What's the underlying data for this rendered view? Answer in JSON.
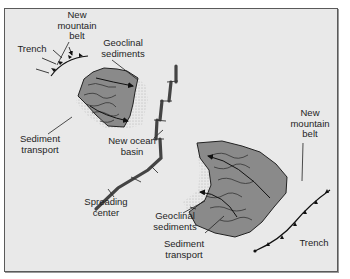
{
  "diagram": {
    "type": "plate tectonics / continental rifting",
    "colors": {
      "background": "#e9e9e9",
      "frame_border": "#5a5a5a",
      "landmass_fill": "#8a8a8a",
      "ridge": "#555555",
      "ink": "#1e1e1e"
    },
    "labels": {
      "left_mountain_belt": "New\nmountain\nbelt",
      "left_trench": "Trench",
      "left_geoclinal": "Geoclinal\nsediments",
      "left_sediment_transport": "Sediment\ntransport",
      "ocean_basin": "New ocean\nbasin",
      "spreading_center": "Spreading\ncenter",
      "right_mountain_belt": "New\nmountain\nbelt",
      "right_geoclinal": "Geoclinal\nsediments",
      "right_sediment_transport": "Sediment\ntransport",
      "right_trench": "Trench"
    }
  }
}
